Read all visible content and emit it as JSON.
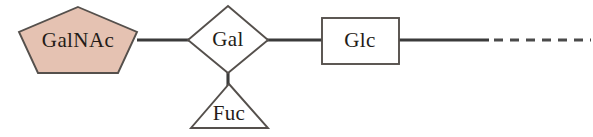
{
  "diagram": {
    "type": "glycan-symbol-nomenclature",
    "background_color": "#ffffff",
    "width": 593,
    "height": 137
  },
  "nodes": [
    {
      "id": "galnac",
      "label": "GalNAc",
      "shape": "pentagon",
      "fill_color": "#e5c2b2",
      "stroke_color": "#55504c",
      "text_color": "#241c18",
      "center_x": 78,
      "center_y": 41,
      "radius_x": 60,
      "radius_y": 36
    },
    {
      "id": "gal",
      "label": "Gal",
      "shape": "diamond",
      "fill_color": "#ffffff",
      "stroke_color": "#55504c",
      "text_color": "#241c18",
      "center_x": 228,
      "center_y": 40,
      "radius_x": 40,
      "radius_y": 34
    },
    {
      "id": "fuc",
      "label": "Fuc",
      "shape": "triangle",
      "fill_color": "#ffffff",
      "stroke_color": "#55504c",
      "text_color": "#241c18",
      "center_x": 229,
      "center_y": 112,
      "apex_y": 84,
      "base_y": 128,
      "base_left_x": 192,
      "base_right_x": 267
    },
    {
      "id": "glc",
      "label": "Glc",
      "shape": "square",
      "fill_color": "#ffffff",
      "stroke_color": "#55504c",
      "text_color": "#241c18",
      "center_x": 360,
      "center_y": 41,
      "left": 322,
      "top": 18,
      "width": 77,
      "height": 46
    }
  ],
  "edges": [
    {
      "id": "galnac-gal",
      "from": "galnac",
      "to": "gal",
      "style": "solid",
      "color": "#3b3b3b",
      "x1": 137,
      "y1": 40,
      "x2": 190,
      "y2": 40
    },
    {
      "id": "gal-glc",
      "from": "gal",
      "to": "glc",
      "style": "solid",
      "color": "#3b3b3b",
      "x1": 266,
      "y1": 40,
      "x2": 323,
      "y2": 40
    },
    {
      "id": "gal-fuc",
      "from": "gal",
      "to": "fuc",
      "style": "solid",
      "color": "#3b3b3b",
      "x1": 228,
      "y1": 70,
      "x2": 228,
      "y2": 90
    },
    {
      "id": "glc-continuation",
      "from": "glc",
      "to": "continuation",
      "style": "solid",
      "color": "#3b3b3b",
      "x1": 398,
      "y1": 40,
      "x2": 489,
      "y2": 40
    },
    {
      "id": "continuation-dashed",
      "from": "continuation",
      "to": "open-end",
      "style": "dashed",
      "color": "#4a4a4a",
      "dash_pattern": "9 7",
      "x1": 494,
      "y1": 40,
      "x2": 590,
      "y2": 40
    }
  ]
}
